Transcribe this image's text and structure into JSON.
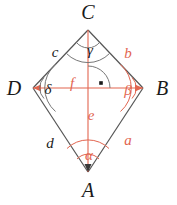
{
  "figure": {
    "type": "geometry-diagram",
    "shape": "rhombus",
    "colors": {
      "outline": "#555555",
      "label_black": "#1a1a1a",
      "label_red": "#e2654f",
      "arc_black": "#777777",
      "arc_red": "#e2654f",
      "background": "#ffffff"
    },
    "vertices": [
      {
        "id": "C",
        "label": "C",
        "x": 88,
        "y": 30,
        "position": "top"
      },
      {
        "id": "D",
        "label": "D",
        "x": 33,
        "y": 88,
        "position": "left"
      },
      {
        "id": "B",
        "label": "B",
        "x": 143,
        "y": 88,
        "position": "right"
      },
      {
        "id": "A",
        "label": "A",
        "x": 88,
        "y": 172,
        "position": "bottom"
      }
    ],
    "vertex_labels": [
      {
        "name": "C",
        "text": "C",
        "x": 88,
        "y": 12,
        "color": "#1a1a1a"
      },
      {
        "name": "D",
        "text": "D",
        "x": 14,
        "y": 88,
        "color": "#1a1a1a"
      },
      {
        "name": "B",
        "text": "B",
        "x": 162,
        "y": 88,
        "color": "#1a1a1a"
      },
      {
        "name": "A",
        "text": "A",
        "x": 88,
        "y": 190,
        "color": "#1a1a1a"
      }
    ],
    "sides": [
      {
        "name": "c",
        "text": "c",
        "between": "D-C",
        "x": 55,
        "y": 52,
        "color": "#1a1a1a"
      },
      {
        "name": "b",
        "text": "b",
        "between": "C-B",
        "x": 128,
        "y": 53,
        "color": "#e2654f"
      },
      {
        "name": "d",
        "text": "d",
        "between": "D-A",
        "x": 50,
        "y": 143,
        "color": "#1a1a1a"
      },
      {
        "name": "a",
        "text": "a",
        "between": "B-A",
        "x": 128,
        "y": 140,
        "color": "#e2654f"
      }
    ],
    "angles": [
      {
        "name": "gamma",
        "text": "γ",
        "at": "C",
        "x": 90,
        "y": 50,
        "color": "#1a1a1a"
      },
      {
        "name": "delta",
        "text": "δ",
        "at": "D",
        "x": 48,
        "y": 89,
        "color": "#1a1a1a"
      },
      {
        "name": "beta",
        "text": "β",
        "at": "B",
        "x": 128,
        "y": 90,
        "color": "#e2654f"
      },
      {
        "name": "alpha",
        "text": "α",
        "at": "A",
        "x": 89,
        "y": 155,
        "color": "#e2654f"
      }
    ],
    "half_diagonals": [
      {
        "name": "f",
        "text": "f",
        "orientation": "horizontal",
        "from": "center",
        "to": "D",
        "x": 72,
        "y": 83,
        "color": "#e2654f"
      },
      {
        "name": "e",
        "text": "e",
        "orientation": "vertical",
        "from": "center",
        "to": "A",
        "x": 91,
        "y": 115,
        "color": "#e2654f"
      }
    ],
    "right_angle": {
      "name": "right-angle-marker",
      "symbol": "·",
      "x": 101,
      "y": 84,
      "note": "diagonals intersect at 90 degrees"
    }
  }
}
